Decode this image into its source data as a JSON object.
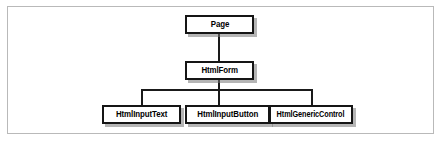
{
  "figure": {
    "type": "class-hierarchy-tree",
    "border_color": "#b9b9b9",
    "background_color": "#ffffff",
    "node_border_color": "#151515",
    "shadow_color": "#787878",
    "line_color": "#1a1a1a"
  },
  "nodes": {
    "root": {
      "label": "Page"
    },
    "form": {
      "label": "HtmlForm"
    },
    "leaf_1": {
      "label": "HtmlInputText"
    },
    "leaf_2": {
      "label": "HtmlInputButton"
    },
    "leaf_3": {
      "label": "HtmlGenericControl"
    }
  },
  "edges": [
    {
      "from": "Page",
      "to": "HtmlForm"
    },
    {
      "from": "HtmlForm",
      "to": "HtmlInputText"
    },
    {
      "from": "HtmlForm",
      "to": "HtmlInputButton"
    },
    {
      "from": "HtmlForm",
      "to": "HtmlGenericControl"
    }
  ]
}
